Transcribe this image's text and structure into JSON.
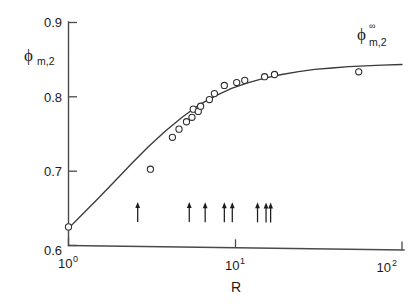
{
  "chart_data": {
    "type": "scatter",
    "title": "",
    "subtitle": "",
    "xlabel": "R",
    "ylabel": "ϕ",
    "ylabel_sub": "m,2",
    "xscale": "log",
    "yscale": "linear",
    "xlim": [
      1,
      100
    ],
    "ylim": [
      0.6,
      0.9
    ],
    "grid": false,
    "legend": null,
    "x_tick_labels": [
      "10",
      "10",
      "10"
    ],
    "x_tick_exponents": [
      "0",
      "1",
      "2"
    ],
    "x_tick_values": [
      1,
      10,
      100
    ],
    "y_tick_labels": [
      "0.6",
      "0.7",
      "0.8",
      "0.9"
    ],
    "y_tick_values": [
      0.6,
      0.7,
      0.8,
      0.9
    ],
    "series": [
      {
        "name": "data points",
        "marker": "open-circle",
        "x": [
          1.0,
          3.1,
          4.2,
          4.6,
          5.1,
          5.5,
          5.6,
          6.0,
          6.2,
          7.0,
          7.5,
          8.6,
          10.2,
          11.4,
          15.0,
          17.2,
          55.0
        ],
        "y": [
          0.625,
          0.703,
          0.746,
          0.757,
          0.767,
          0.773,
          0.784,
          0.781,
          0.788,
          0.797,
          0.805,
          0.816,
          0.82,
          0.823,
          0.828,
          0.831,
          0.835
        ]
      },
      {
        "name": "fitted curve",
        "type": "line",
        "x": [
          1.0,
          1.2,
          1.5,
          1.9,
          2.4,
          3.0,
          3.8,
          4.8,
          6.0,
          7.6,
          9.5,
          12.0,
          15.0,
          19.0,
          24.0,
          30.0,
          38.0,
          48.0,
          60.0,
          76.0,
          100.0
        ],
        "y": [
          0.623,
          0.641,
          0.663,
          0.687,
          0.711,
          0.733,
          0.754,
          0.773,
          0.789,
          0.802,
          0.812,
          0.82,
          0.826,
          0.831,
          0.835,
          0.838,
          0.84,
          0.842,
          0.843,
          0.844,
          0.845
        ]
      }
    ],
    "annotations": [
      {
        "name": "asymptote-label",
        "text": "ϕ",
        "superscript": "∞",
        "subscript": "m,2",
        "x": 75,
        "y": 0.875
      }
    ],
    "arrow_markers": {
      "name": "tick-arrows",
      "count": 8,
      "y": 0.632,
      "x": [
        2.6,
        5.3,
        6.6,
        8.6,
        9.6,
        13.6,
        15.3,
        16.3
      ],
      "direction": "up"
    },
    "colors": {
      "axis": "#4a4a4a",
      "curve": "#3a3a3a",
      "marker_edge": "#2e2e2e",
      "marker_fill": "#ffffff",
      "arrow": "#1c1c1c",
      "text": "#1b1b1b",
      "background": "#ffffff"
    }
  }
}
